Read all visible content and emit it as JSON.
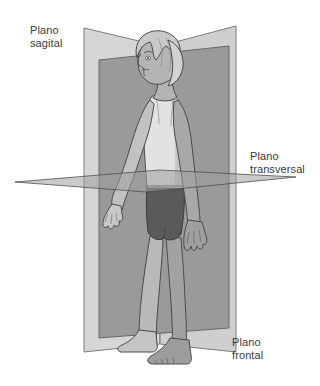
{
  "diagram": {
    "background_color": "#ffffff",
    "labels": {
      "sagittal": "Plano\nsagital",
      "transversal": "Plano\ntransversal",
      "frontal": "Plano\nfrontal"
    },
    "label_color": "#3a3a3a"
  },
  "planes": [
    {
      "name": "frontal",
      "label": "Plano frontal",
      "fill": "#d6d6d6",
      "stroke": "#6e6e6e",
      "description": "Plano vertical claro que divide el cuerpo en parte anterior y posterior"
    },
    {
      "name": "sagittal",
      "label": "Plano sagital",
      "fill": "#9a9a9a",
      "stroke": "#5f5f5f",
      "description": "Plano vertical oscuro que divide el cuerpo en mitad derecha e izquierda"
    },
    {
      "name": "transversal",
      "label": "Plano transversal",
      "fill": "#9e9e9e",
      "stroke": "#4a4a4a",
      "description": "Plano horizontal que divide el cuerpo en parte superior e inferior"
    }
  ],
  "figure": {
    "name": "human-figure",
    "pose": "de pie, de perfil hacia la izquierda",
    "skin_fill": "#b4b4b4",
    "skin_shadow": "#8f8f8f",
    "hair_fill": "#c9c9c9",
    "top_fill": "#e2e2e2",
    "shorts_fill": "#5a5a5a",
    "outline": "#4a4a4a"
  }
}
